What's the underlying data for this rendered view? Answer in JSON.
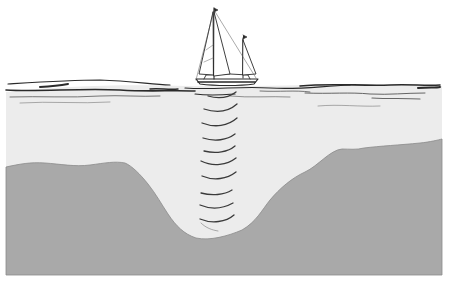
{
  "illustration": {
    "subject": "sailboat echo sounding seabed trench",
    "colors": {
      "sky": "#ffffff",
      "water": "#ececec",
      "seabed": "#a9a9a9",
      "ink": "#2a2a2a",
      "sonar": "#3a3a3a"
    },
    "elements": {
      "boat": "sailboat-icon",
      "sea_surface": "wave-lines",
      "sonar": "sonar-arcs",
      "seabed": "seabed-profile"
    },
    "sonar_arc_count": 11
  }
}
